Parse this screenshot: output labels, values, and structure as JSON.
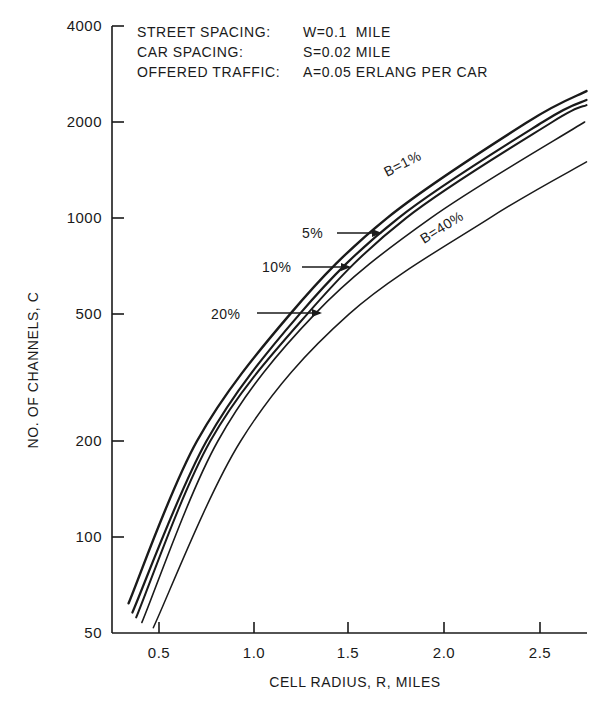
{
  "chart_data": {
    "type": "line",
    "title": "",
    "xlabel": "CELL RADIUS, R, MILES",
    "ylabel": "NO. OF CHANNELS, C",
    "xscale": "linear",
    "yscale": "log",
    "xlim": [
      0.25,
      2.75
    ],
    "ylim": [
      50,
      4000
    ],
    "x_ticks": [
      0.5,
      1.0,
      1.5,
      2.0,
      2.5
    ],
    "x_tick_labels": [
      "0.5",
      "1.0",
      "1.5",
      "2.0",
      "2.5"
    ],
    "y_ticks": [
      50,
      100,
      200,
      500,
      1000,
      2000,
      4000
    ],
    "y_tick_labels": [
      "50",
      "100",
      "200",
      "500",
      "1000",
      "2000",
      "4000"
    ],
    "grid": false,
    "annotations": [
      {
        "label": "STREET SPACING:",
        "value": "W=0.1  MILE"
      },
      {
        "label": "CAR SPACING:",
        "value": "S=0.02 MILE"
      },
      {
        "label": "OFFERED TRAFFIC:",
        "value": "A=0.05 ERLANG PER CAR"
      }
    ],
    "series": [
      {
        "name": "B=1%",
        "label": "B=1%",
        "points": [
          [
            0.34,
            62
          ],
          [
            0.7,
            200
          ],
          [
            1.19,
            500
          ],
          [
            1.7,
            1000
          ],
          [
            2.44,
            2000
          ],
          [
            2.75,
            2500
          ]
        ]
      },
      {
        "name": "B=5%",
        "label": "5%",
        "points": [
          [
            0.36,
            58
          ],
          [
            0.75,
            200
          ],
          [
            1.24,
            500
          ],
          [
            1.76,
            1000
          ],
          [
            2.52,
            2000
          ],
          [
            2.75,
            2345
          ]
        ]
      },
      {
        "name": "B=10%",
        "label": "10%",
        "points": [
          [
            0.38,
            56
          ],
          [
            0.77,
            200
          ],
          [
            1.28,
            500
          ],
          [
            1.8,
            1000
          ],
          [
            2.57,
            2000
          ],
          [
            2.75,
            2260
          ]
        ]
      },
      {
        "name": "B=20%",
        "label": "20%",
        "points": [
          [
            0.41,
            54
          ],
          [
            0.81,
            200
          ],
          [
            1.32,
            500
          ],
          [
            1.93,
            1000
          ],
          [
            2.74,
            2000
          ]
        ]
      },
      {
        "name": "B=40%",
        "label": "B=40%",
        "points": [
          [
            0.47,
            52
          ],
          [
            0.93,
            200
          ],
          [
            1.5,
            500
          ],
          [
            2.24,
            1000
          ],
          [
            2.75,
            1500
          ]
        ]
      }
    ],
    "legend": "inline labels with arrows"
  },
  "labels": {
    "params": {
      "street_label": "STREET SPACING:",
      "street_value": "W=0.1  MILE",
      "car_label": "CAR SPACING:",
      "car_value": "S=0.02 MILE",
      "traffic_label": "OFFERED TRAFFIC:",
      "traffic_value": "A=0.05 ERLANG PER CAR"
    },
    "curves": {
      "b1": "B=1%",
      "b5": "5%",
      "b10": "10%",
      "b20": "20%",
      "b40": "B=40%"
    },
    "xaxis": {
      "title": "CELL RADIUS, R, MILES",
      "t0": "0.5",
      "t1": "1.0",
      "t2": "1.5",
      "t3": "2.0",
      "t4": "2.5"
    },
    "yaxis": {
      "title": "NO. OF CHANNELS, C",
      "t50": "50",
      "t100": "100",
      "t200": "200",
      "t500": "500",
      "t1000": "1000",
      "t2000": "2000",
      "t4000": "4000"
    }
  }
}
